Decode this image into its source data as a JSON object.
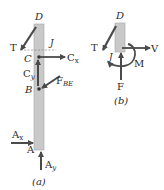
{
  "figure": {
    "panel_a": {
      "caption": "(a)",
      "labels": {
        "D": "D",
        "J": "J",
        "T": "T",
        "C": "C",
        "Cx_main": "C",
        "Cx_sub": "x",
        "Cy_main": "C",
        "Cy_sub": "y",
        "B": "B",
        "FBE_main": "F",
        "FBE_sub": "BE",
        "Ax_main": "A",
        "Ax_sub": "x",
        "A": "A",
        "Ay_main": "A",
        "Ay_sub": "y"
      }
    },
    "panel_b": {
      "caption": "(b)",
      "labels": {
        "D": "D",
        "T": "T",
        "J": "J",
        "V": "V",
        "M": "M",
        "F": "F"
      }
    },
    "colors": {
      "bar_fill": "#c9c9c9",
      "bar_stroke": "#9a9a9a",
      "arrow": "#4a4a4a",
      "text": "#2a2a2a"
    }
  }
}
